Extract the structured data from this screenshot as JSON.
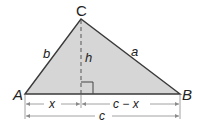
{
  "diagram": {
    "vertices": {
      "A": "A",
      "B": "B",
      "C": "C"
    },
    "sides": {
      "a": "a",
      "b": "b"
    },
    "altitude": "h",
    "segments": {
      "left": "x",
      "right": "c − x",
      "total": "c"
    },
    "colors": {
      "fill": "#d6d6d6",
      "stroke": "#3a3a3a",
      "dim": "#8a8a8a"
    }
  }
}
